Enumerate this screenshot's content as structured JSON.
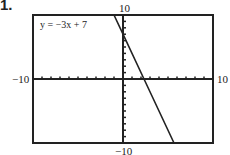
{
  "problem_number": "1.",
  "chart_data": {
    "type": "line",
    "title": "",
    "equation_label": "y = −3x + 7",
    "series": [
      {
        "name": "y = −3x + 7",
        "x": [
          -1,
          0,
          2.333,
          5.667
        ],
        "y": [
          10,
          7,
          0,
          -10
        ]
      }
    ],
    "xlim": [
      -10,
      10
    ],
    "ylim": [
      -10,
      10
    ],
    "xscale_ticks": 1,
    "yscale_ticks": 1,
    "tick_labels": {
      "xmin": "−10",
      "xmax": "10",
      "ymin": "−10",
      "ymax": "10"
    },
    "grid": false,
    "xlabel": "",
    "ylabel": ""
  }
}
